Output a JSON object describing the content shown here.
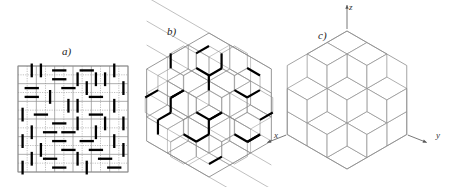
{
  "figure": {
    "background_color": "#ffffff",
    "lattice_line_color": "#8c8c8c",
    "dimer_color": "#000000",
    "axis_color": "#555555",
    "width": 451,
    "height": 187
  },
  "panels": [
    {
      "id": "a",
      "label": "a)",
      "label_x": 62,
      "label_y": 48,
      "caption_kind": "square-lattice-dimer-cover",
      "box": {
        "x": 18,
        "y": 66,
        "w": 110,
        "h": 106
      },
      "grid": {
        "cols": 12,
        "rows": 12,
        "cell_w": 9.1667,
        "cell_h": 8.8333
      },
      "dimers": [
        {
          "c": 1,
          "r": 0,
          "orient": "v"
        },
        {
          "c": 2,
          "r": 0,
          "orient": "v"
        },
        {
          "c": 4,
          "r": 0,
          "orient": "h"
        },
        {
          "c": 7,
          "r": 0,
          "orient": "h"
        },
        {
          "c": 10,
          "r": 0,
          "orient": "v"
        },
        {
          "c": 6,
          "r": 1,
          "orient": "v"
        },
        {
          "c": 4,
          "r": 1,
          "orient": "h"
        },
        {
          "c": 8,
          "r": 1,
          "orient": "v"
        },
        {
          "c": 9,
          "r": 1,
          "orient": "v"
        },
        {
          "c": 1,
          "r": 2,
          "orient": "h"
        },
        {
          "c": 5,
          "r": 2,
          "orient": "h"
        },
        {
          "c": 7,
          "r": 2,
          "orient": "v"
        },
        {
          "c": 11,
          "r": 2,
          "orient": "v"
        },
        {
          "c": 3,
          "r": 3,
          "orient": "v"
        },
        {
          "c": 1,
          "r": 3,
          "orient": "h"
        },
        {
          "c": 8,
          "r": 3,
          "orient": "h"
        },
        {
          "c": 5,
          "r": 4,
          "orient": "v"
        },
        {
          "c": 6,
          "r": 4,
          "orient": "v"
        },
        {
          "c": 10,
          "r": 4,
          "orient": "v"
        },
        {
          "c": 0,
          "r": 5,
          "orient": "v"
        },
        {
          "c": 2,
          "r": 5,
          "orient": "h"
        },
        {
          "c": 8,
          "r": 5,
          "orient": "h"
        },
        {
          "c": 4,
          "r": 6,
          "orient": "h"
        },
        {
          "c": 6,
          "r": 6,
          "orient": "v"
        },
        {
          "c": 9,
          "r": 6,
          "orient": "v"
        },
        {
          "c": 11,
          "r": 6,
          "orient": "v"
        },
        {
          "c": 1,
          "r": 7,
          "orient": "v"
        },
        {
          "c": 3,
          "r": 7,
          "orient": "h"
        },
        {
          "c": 5,
          "r": 7,
          "orient": "h"
        },
        {
          "c": 8,
          "r": 7,
          "orient": "v"
        },
        {
          "c": 0,
          "r": 8,
          "orient": "v"
        },
        {
          "c": 4,
          "r": 8,
          "orient": "h"
        },
        {
          "c": 7,
          "r": 8,
          "orient": "h"
        },
        {
          "c": 10,
          "r": 8,
          "orient": "v"
        },
        {
          "c": 2,
          "r": 9,
          "orient": "v"
        },
        {
          "c": 5,
          "r": 9,
          "orient": "h"
        },
        {
          "c": 8,
          "r": 9,
          "orient": "h"
        },
        {
          "c": 11,
          "r": 9,
          "orient": "v"
        },
        {
          "c": 1,
          "r": 10,
          "orient": "v"
        },
        {
          "c": 3,
          "r": 10,
          "orient": "h"
        },
        {
          "c": 6,
          "r": 10,
          "orient": "v"
        },
        {
          "c": 9,
          "r": 10,
          "orient": "h"
        },
        {
          "c": 0,
          "r": 11,
          "orient": "v"
        },
        {
          "c": 4,
          "r": 11,
          "orient": "h"
        },
        {
          "c": 7,
          "r": 11,
          "orient": "v"
        },
        {
          "c": 10,
          "r": 11,
          "orient": "h"
        }
      ]
    },
    {
      "id": "b",
      "label": "b)",
      "label_x": 167,
      "label_y": 28,
      "caption_kind": "honeycomb-lattice-dimer-cover-in-hexagon",
      "center": {
        "x": 209,
        "y": 105
      },
      "hex_radius": 72,
      "honeycomb_step": 12,
      "dimer_count": 38
    },
    {
      "id": "c",
      "label": "c)",
      "label_x": 318,
      "label_y": 32,
      "caption_kind": "lozenge-tiling-stepped-surface",
      "center": {
        "x": 347,
        "y": 100
      },
      "hex_size": 3,
      "rhombus_unit": 23,
      "axes": [
        {
          "name": "z",
          "label": "z",
          "label_x": 348,
          "label_y": 5,
          "from": [
            347,
            34
          ],
          "to": [
            347,
            10
          ],
          "arrow": "up"
        },
        {
          "name": "x",
          "label": "x",
          "label_x": 276,
          "label_y": 133,
          "from": [
            300,
            133
          ],
          "to": [
            281,
            141
          ],
          "arrow": "down-left"
        },
        {
          "name": "y",
          "label": "y",
          "label_x": 434,
          "label_y": 133,
          "from": [
            412,
            133
          ],
          "to": [
            430,
            141
          ],
          "arrow": "down-right"
        }
      ]
    }
  ],
  "legend": {
    "panel_a_name": "square lattice dimer configuration",
    "panel_b_name": "honeycomb lattice dimer configuration",
    "panel_c_name": "equivalent lozenge tiling / stepped surface"
  }
}
